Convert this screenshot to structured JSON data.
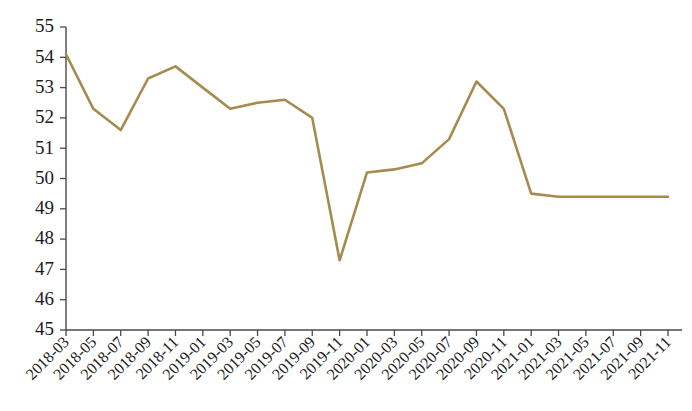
{
  "chart_data": {
    "type": "line",
    "title": "",
    "subtitle": "",
    "xlabel": "",
    "ylabel": "",
    "legend": [],
    "legend_position": "none",
    "grid": false,
    "ylim": [
      45,
      55
    ],
    "ytick_labels": [
      "45",
      "46",
      "47",
      "48",
      "49",
      "50",
      "51",
      "52",
      "53",
      "54",
      "55"
    ],
    "ytick_values": [
      45,
      46,
      47,
      48,
      49,
      50,
      51,
      52,
      53,
      54,
      55
    ],
    "categories": [
      "2018-03",
      "2018-05",
      "2018-07",
      "2018-09",
      "2018-11",
      "2019-01",
      "2019-03",
      "2019-05",
      "2019-07",
      "2019-09",
      "2019-11",
      "2020-01",
      "2020-03",
      "2020-05",
      "2020-07",
      "2020-09",
      "2020-11",
      "2021-01",
      "2021-03",
      "2021-05",
      "2021-07",
      "2021-09",
      "2021-11"
    ],
    "series": [
      {
        "name": "series-1",
        "color": "#a68b4f",
        "values": [
          54.1,
          52.3,
          51.6,
          53.3,
          53.7,
          53.0,
          52.3,
          52.5,
          52.6,
          52.0,
          47.3,
          50.2,
          50.3,
          50.5,
          51.3,
          53.2,
          52.3,
          49.5,
          49.4,
          49.4,
          49.4,
          49.4,
          49.4
        ]
      }
    ],
    "colors": {
      "line": "#a68b4f",
      "axis": "#4a4a4a",
      "text": "#1b1b1b",
      "background": "#ffffff"
    },
    "axis_label_rotation": -45
  }
}
